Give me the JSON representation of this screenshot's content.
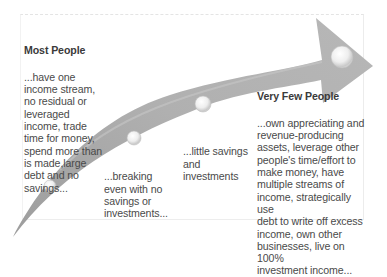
{
  "diagram": {
    "type": "curved-progress-arrow",
    "colors": {
      "arrow_fill": "#a9a9a9",
      "arrow_highlight": "#c8c8c8",
      "bubble_fill": "#f4f4f4",
      "text": "#4a4a4a",
      "background": "#ffffff"
    },
    "stages": [
      {
        "heading": "Most People",
        "body": "...have one\nincome stream,\nno residual or\nleveraged\nincome, trade\ntime for money,\nspend more than\nis made,large\ndebt and no\nsavings..."
      },
      {
        "heading": "",
        "body": "...breaking\neven with no\nsavings or\ninvestments..."
      },
      {
        "heading": "",
        "body": "...little savings\nand\ninvestments"
      },
      {
        "heading": "Very Few People",
        "body": "...own appreciating and\nrevenue-producing\nassets, leverage other\npeople's time/effort to\nmake money, have\nmultiple streams of\nincome, strategically use\ndebt to write off excess\nincome, own other\nbusinesses, live on 100%\ninvestment income..."
      }
    ]
  }
}
